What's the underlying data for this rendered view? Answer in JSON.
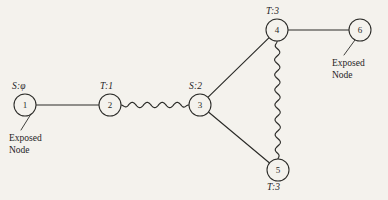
{
  "figure": {
    "background_color": "#f4f2ed",
    "ink_color": "#2b2b28",
    "width": 388,
    "height": 200
  },
  "nodes": [
    {
      "id": "1",
      "label": "1",
      "cx": 25,
      "cy": 105,
      "r": 11,
      "state_label": "S:φ",
      "state_x": 12,
      "state_y": 81
    },
    {
      "id": "2",
      "label": "2",
      "cx": 110,
      "cy": 105,
      "r": 11,
      "state_label": "T:1",
      "state_x": 100,
      "state_y": 81
    },
    {
      "id": "3",
      "label": "3",
      "cx": 200,
      "cy": 105,
      "r": 11,
      "state_label": "S:2",
      "state_x": 189,
      "state_y": 81
    },
    {
      "id": "4",
      "label": "4",
      "cx": 277,
      "cy": 30,
      "r": 11,
      "state_label": "T:3",
      "state_x": 266,
      "state_y": 6
    },
    {
      "id": "5",
      "label": "5",
      "cx": 278,
      "cy": 170,
      "r": 11,
      "state_label": "T:3",
      "state_x": 267,
      "state_y": 182
    },
    {
      "id": "6",
      "label": "6",
      "cx": 360,
      "cy": 30,
      "r": 11,
      "state_label": "",
      "state_x": 0,
      "state_y": 0
    }
  ],
  "edges": [
    {
      "from": "1",
      "to": "2",
      "style": "straight"
    },
    {
      "from": "2",
      "to": "3",
      "style": "wavy"
    },
    {
      "from": "3",
      "to": "4",
      "style": "straight"
    },
    {
      "from": "3",
      "to": "5",
      "style": "straight"
    },
    {
      "from": "4",
      "to": "5",
      "style": "wavy"
    },
    {
      "from": "4",
      "to": "6",
      "style": "straight"
    }
  ],
  "annotations": [
    {
      "id": "exposed-node-1",
      "line1": "Exposed",
      "line2": "Node",
      "text_x": 9,
      "text_y": 133,
      "leader": {
        "x1": 31,
        "y1": 114,
        "x2": 21,
        "y2": 130
      }
    },
    {
      "id": "exposed-node-6",
      "line1": "Exposed",
      "line2": "Node",
      "text_x": 332,
      "text_y": 58,
      "leader": {
        "x1": 355,
        "y1": 40,
        "x2": 344,
        "y2": 55
      }
    }
  ]
}
